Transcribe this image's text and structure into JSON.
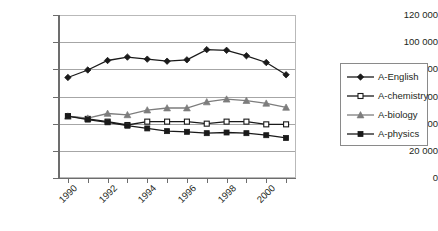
{
  "chart_data": {
    "type": "line",
    "title": "",
    "xlabel": "",
    "ylabel": "",
    "ylim": [
      0,
      120000
    ],
    "ytick_labels": [
      "120 000",
      "100 000",
      "80 000",
      "60 000",
      "40 000",
      "20 000",
      "0"
    ],
    "ytick_values": [
      120000,
      100000,
      80000,
      60000,
      40000,
      20000,
      0
    ],
    "grid": true,
    "legend_position": "right",
    "x": [
      1990,
      1991,
      1992,
      1993,
      1994,
      1995,
      1996,
      1997,
      1998,
      1999,
      2000,
      2001
    ],
    "xtick_labels": [
      "1990",
      "1992",
      "1994",
      "1996",
      "1998",
      "2000"
    ],
    "xtick_values": [
      1990,
      1992,
      1994,
      1996,
      1998,
      2000
    ],
    "series": [
      {
        "name": "A-English",
        "marker": "filled-diamond",
        "color": "#1a1a1a",
        "values": [
          74000,
          79500,
          86500,
          89000,
          87500,
          86000,
          87000,
          94500,
          94000,
          90000,
          85000,
          76000
        ]
      },
      {
        "name": "A-chemistry",
        "marker": "open-square",
        "color": "#1a1a1a",
        "values": [
          45500,
          43500,
          41500,
          39000,
          41500,
          41500,
          41500,
          40000,
          41500,
          41500,
          39500,
          39500
        ]
      },
      {
        "name": "A-biology",
        "marker": "filled-triangle",
        "color": "#7d7d7d",
        "values": [
          45500,
          44000,
          47500,
          46500,
          50000,
          51500,
          51500,
          56000,
          58000,
          57000,
          55000,
          52000
        ]
      },
      {
        "name": "A-physics",
        "marker": "filled-square",
        "color": "#1a1a1a",
        "values": [
          45500,
          43000,
          41000,
          38500,
          36500,
          34500,
          34000,
          33000,
          33500,
          33000,
          31500,
          29500
        ]
      }
    ]
  },
  "legend": {
    "items": [
      {
        "label": "A-English"
      },
      {
        "label": "A-chemistry"
      },
      {
        "label": "A-biology"
      },
      {
        "label": "A-physics"
      }
    ]
  }
}
